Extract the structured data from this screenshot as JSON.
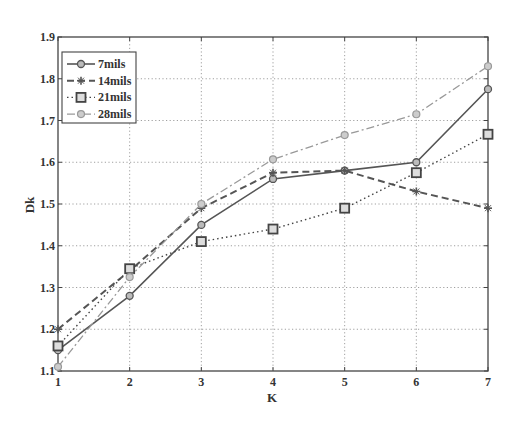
{
  "chart_data": {
    "type": "line",
    "title": "",
    "xlabel": "K",
    "ylabel": "Dk",
    "x": [
      1,
      2,
      3,
      4,
      5,
      6,
      7
    ],
    "xticks": [
      "1",
      "2",
      "3",
      "4",
      "5",
      "6",
      "7"
    ],
    "yticks": [
      "1.1",
      "1.2",
      "1.3",
      "1.4",
      "1.5",
      "1.6",
      "1.7",
      "1.8",
      "1.9"
    ],
    "xlim": [
      1,
      7
    ],
    "ylim": [
      1.1,
      1.9
    ],
    "grid": true,
    "legend_position": "upper left",
    "series": [
      {
        "name": "7mils",
        "linestyle": "solid",
        "marker": "circle",
        "color": "#555555",
        "values": [
          1.15,
          1.28,
          1.45,
          1.56,
          1.58,
          1.6,
          1.775
        ]
      },
      {
        "name": "14mils",
        "linestyle": "dashed",
        "marker": "star",
        "color": "#555555",
        "values": [
          1.2,
          1.34,
          1.49,
          1.575,
          1.58,
          1.53,
          1.49
        ]
      },
      {
        "name": "21mils",
        "linestyle": "dotted",
        "marker": "square",
        "color": "#444444",
        "values": [
          1.16,
          1.345,
          1.41,
          1.44,
          1.49,
          1.575,
          1.667
        ]
      },
      {
        "name": "28mils",
        "linestyle": "dashdot",
        "marker": "diamond",
        "color": "#999999",
        "values": [
          1.11,
          1.325,
          1.5,
          1.607,
          1.665,
          1.715,
          1.83
        ]
      }
    ]
  }
}
